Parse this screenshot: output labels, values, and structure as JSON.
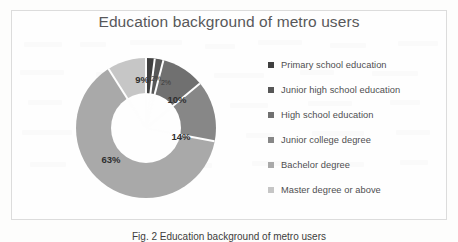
{
  "figure": {
    "title": "Education background of metro users",
    "caption": "Fig. 2  Education background of metro users",
    "frame_border_color": "#dcdcdc",
    "background_color": "#fdfdfc",
    "title_color": "#58585a"
  },
  "legend": {
    "position": "right",
    "items": [
      {
        "label": "Primary school education",
        "marker": "legend-marker-square",
        "color": "#3f3f3f"
      },
      {
        "label": "Junior high school education",
        "marker": "legend-marker-square",
        "color": "#575757"
      },
      {
        "label": "High school education",
        "marker": "legend-marker-square",
        "color": "#707070"
      },
      {
        "label": "Junior college degree",
        "marker": "legend-marker-square",
        "color": "#878787"
      },
      {
        "label": "Bachelor degree",
        "marker": "legend-marker-square",
        "color": "#a9a9a9"
      },
      {
        "label": "Master degree or above",
        "marker": "legend-marker-square",
        "color": "#c6c6c6"
      }
    ]
  },
  "chart_data": {
    "type": "pie",
    "variant": "doughnut",
    "title": "Education background of metro users",
    "xlabel": "",
    "ylabel": "",
    "grid": false,
    "legend_position": "right",
    "categories": [
      "Primary school education",
      "Junior high school education",
      "High school education",
      "Junior college degree",
      "Bachelor degree",
      "Master degree or above"
    ],
    "values": [
      2,
      2,
      10,
      14,
      63,
      9
    ],
    "data_labels": [
      "2%",
      "2%",
      "10%",
      "14%",
      "63%",
      "9%"
    ],
    "colors": [
      "#3f3f3f",
      "#575757",
      "#707070",
      "#878787",
      "#a9a9a9",
      "#c6c6c6"
    ],
    "units": "percent",
    "total": 100,
    "start_angle_deg": 0,
    "direction": "clockwise",
    "inner_radius_ratio": 0.5
  },
  "slice_labels": [
    {
      "text": "2%",
      "x": 80,
      "y": 20,
      "size": "tiny"
    },
    {
      "text": "2%",
      "x": 90,
      "y": 24,
      "size": "tiny"
    },
    {
      "text": "10%",
      "x": 101,
      "y": 41,
      "size": "normal"
    },
    {
      "text": "14%",
      "x": 105,
      "y": 78,
      "size": "normal"
    },
    {
      "text": "63%",
      "x": 35,
      "y": 101,
      "size": "normal"
    },
    {
      "text": "9%",
      "x": 66,
      "y": 21,
      "size": "normal"
    }
  ]
}
